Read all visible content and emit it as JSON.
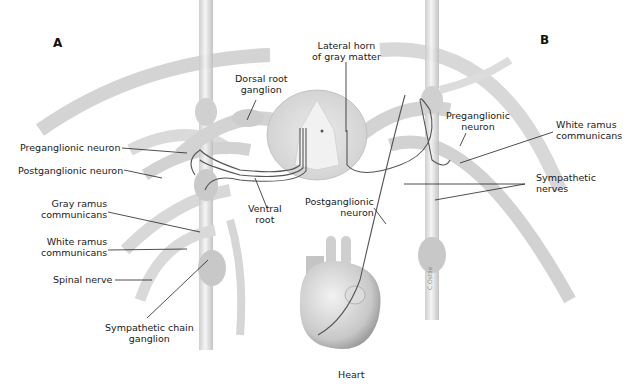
{
  "figure": {
    "panels": {
      "a": "A",
      "b": "B"
    },
    "labels": {
      "lateral_horn": [
        "Lateral horn",
        "of gray matter"
      ],
      "dorsal_root_ganglion": [
        "Dorsal root",
        "ganglion"
      ],
      "preganglionic_neuron_a": "Preganglionic neuron",
      "postganglionic_neuron_a": "Postganglionic neuron",
      "ventral_root": [
        "Ventral",
        "root"
      ],
      "gray_ramus": [
        "Gray ramus",
        "communicans"
      ],
      "white_ramus_a": [
        "White ramus",
        "communicans"
      ],
      "spinal_nerve": "Spinal nerve",
      "sympathetic_chain_ganglion": [
        "Sympathetic chain",
        "ganglion"
      ],
      "postganglionic_neuron_b": [
        "Postganglionic",
        "neuron"
      ],
      "preganglionic_neuron_b": [
        "Preganglionic",
        "neuron"
      ],
      "white_ramus_b": [
        "White ramus",
        "communicans"
      ],
      "sympathetic_nerves": [
        "Sympathetic",
        "nerves"
      ],
      "heart": "Heart",
      "signature": "C.Ostlie"
    }
  }
}
